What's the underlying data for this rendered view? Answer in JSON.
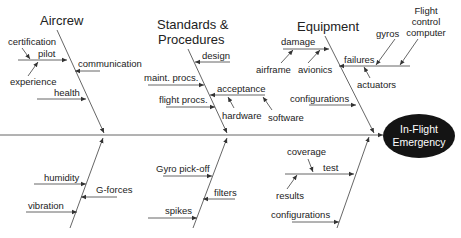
{
  "diagram": {
    "type": "fishbone",
    "effect": {
      "line1": "In-Flight",
      "line2": "Emergency",
      "fill": "#141414",
      "text_color": "#ffffff"
    },
    "categories": {
      "aircrew": {
        "label": "Aircrew",
        "causes": {
          "pilot": "pilot",
          "certification": "certification",
          "experience": "experience",
          "communication": "communication",
          "health": "health"
        }
      },
      "standards": {
        "label_line1": "Standards &",
        "label_line2": "Procedures",
        "causes": {
          "design": "design",
          "maint": "maint. procs.",
          "flight": "flight procs.",
          "acceptance": "acceptance",
          "hardware": "hardware",
          "software": "software"
        }
      },
      "equipment": {
        "label": "Equipment",
        "causes": {
          "damage": "damage",
          "airframe": "airframe",
          "avionics": "avionics",
          "failures": "failures",
          "gyros": "gyros",
          "fcc_line1": "Flight",
          "fcc_line2": "control",
          "fcc_line3": "computer",
          "actuators": "actuators",
          "configurations": "configurations"
        }
      },
      "environment": {
        "causes": {
          "humidity": "humidity",
          "gforces": "G-forces",
          "vibration": "vibration"
        }
      },
      "signal": {
        "causes": {
          "gyro_pickoff": "Gyro pick-off",
          "filters": "filters",
          "spikes": "spikes"
        }
      },
      "testing": {
        "causes": {
          "coverage": "coverage",
          "test": "test",
          "results": "results",
          "configurations": "configurations"
        }
      }
    },
    "colors": {
      "line": "#555555",
      "text": "#222222",
      "background": "#ffffff"
    }
  }
}
